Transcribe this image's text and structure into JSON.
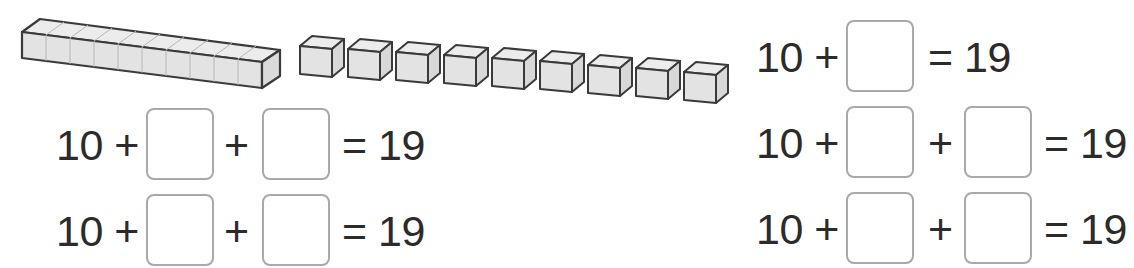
{
  "worksheet": {
    "manipulatives": {
      "ten_rod": {
        "label": "ten-rod",
        "units": 10
      },
      "single_cubes": {
        "count": 9
      }
    },
    "equations": [
      {
        "id": "eq-left-1",
        "tokens": [
          "10 +",
          "+",
          "= 19"
        ],
        "blanks": 2
      },
      {
        "id": "eq-left-2",
        "tokens": [
          "10 +",
          "+",
          "= 19"
        ],
        "blanks": 2
      },
      {
        "id": "eq-right-1",
        "tokens": [
          "10 +",
          "= 19"
        ],
        "blanks": 1
      },
      {
        "id": "eq-right-2",
        "tokens": [
          "10 +",
          "+",
          "= 19"
        ],
        "blanks": 2
      },
      {
        "id": "eq-right-3",
        "tokens": [
          "10 +",
          "+",
          "= 19"
        ],
        "blanks": 2
      }
    ]
  },
  "colors": {
    "text": "#2b2b2b",
    "box_border": "#a9a9a9",
    "cube_fill": "#e6e6e6",
    "cube_stroke": "#3a3a3a"
  }
}
